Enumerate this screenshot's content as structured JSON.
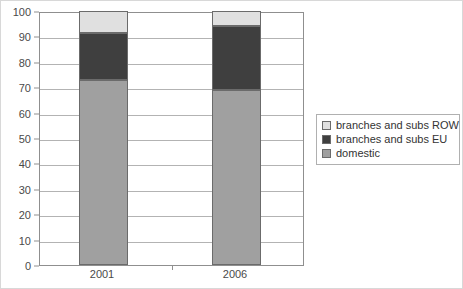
{
  "chart_data": {
    "type": "bar",
    "subtype": "stacked-bar-100-percent",
    "title": "",
    "subtitle": "",
    "xlabel": "",
    "ylabel": "",
    "categories": [
      "2001",
      "2006"
    ],
    "series": [
      {
        "name": "domestic",
        "values": [
          73,
          69
        ],
        "color": "#a0a0a0"
      },
      {
        "name": "branches and subs EU",
        "values": [
          18.5,
          25
        ],
        "color": "#3f3f3f"
      },
      {
        "name": "branches and subs ROW",
        "values": [
          8.5,
          6
        ],
        "color": "#e0e0e0"
      }
    ],
    "cumulative_tops": {
      "2001": {
        "domestic": 73,
        "branches and subs EU": 91.5,
        "branches and subs ROW": 100
      },
      "2006": {
        "domestic": 69,
        "branches and subs EU": 94,
        "branches and subs ROW": 100
      }
    },
    "ylim": [
      0,
      100
    ],
    "ytick_labels": [
      "0",
      "10",
      "20",
      "30",
      "40",
      "50",
      "60",
      "70",
      "80",
      "90",
      "100"
    ],
    "ytick_values": [
      0,
      10,
      20,
      30,
      40,
      50,
      60,
      70,
      80,
      90,
      100
    ],
    "grid": true,
    "grid_axis": "y",
    "legend_position": "right",
    "legend_entries": [
      {
        "label": "branches and subs ROW",
        "color": "#e0e0e0"
      },
      {
        "label": "branches and subs EU",
        "color": "#3f3f3f"
      },
      {
        "label": "domestic",
        "color": "#a0a0a0"
      }
    ]
  },
  "colors": {
    "light_gray": "#e0e0e0",
    "dark_gray": "#3f3f3f",
    "medium_gray": "#a0a0a0",
    "axis": "#8f8f8f",
    "grid": "#b3b3b3",
    "text": "#4a4a4a",
    "background": "#ffffff"
  }
}
